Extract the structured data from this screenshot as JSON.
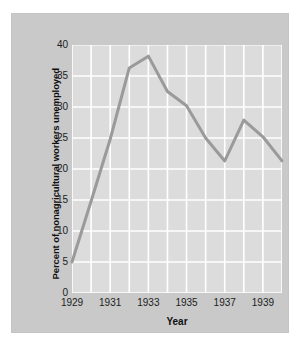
{
  "chart_data": {
    "type": "line",
    "title": "",
    "xlabel": "Year",
    "ylabel": "Percent of nonagricultural workers unemployed",
    "x": [
      1929,
      1930,
      1931,
      1932,
      1933,
      1934,
      1935,
      1936,
      1937,
      1938,
      1939,
      1940
    ],
    "values": [
      5.0,
      14.8,
      24.8,
      36.3,
      38.2,
      32.5,
      30.2,
      25.0,
      21.3,
      27.9,
      25.2,
      21.3
    ],
    "series": [
      {
        "name": "Percent of nonagricultural workers unemployed",
        "values": [
          5.0,
          14.8,
          24.8,
          36.3,
          38.2,
          32.5,
          30.2,
          25.0,
          21.3,
          27.9,
          25.2,
          21.3
        ]
      }
    ],
    "ylim": [
      0,
      40
    ],
    "xlim": [
      1929,
      1940
    ],
    "ytick_labels": [
      "0",
      "5",
      "10",
      "15",
      "20",
      "25",
      "30",
      "35",
      "40"
    ],
    "ytick_values": [
      0,
      5,
      10,
      15,
      20,
      25,
      30,
      35,
      40
    ],
    "xtick_labels": [
      "1929",
      "1931",
      "1933",
      "1935",
      "1937",
      "1939"
    ],
    "xtick_values": [
      1929,
      1931,
      1933,
      1935,
      1937,
      1939
    ],
    "grid": true,
    "legend": "none",
    "line_color": "#9a9a9a",
    "panel_color": "#dcdcdc",
    "grid_color": "#ffffff",
    "frame_color": "#c9c9c9",
    "text_color": "#1c1c1c"
  }
}
